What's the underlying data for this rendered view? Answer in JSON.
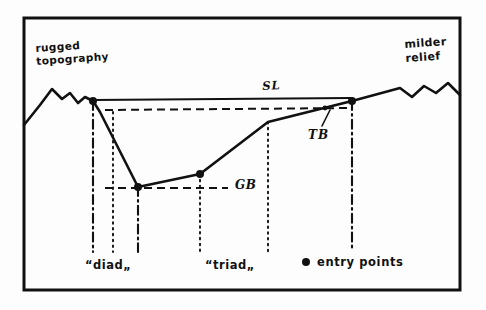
{
  "figure": {
    "kind": "hand-drawn cross-section diagram",
    "background_color": "#fdfdfd",
    "ink_color": "#111111",
    "frame": {
      "x": 24,
      "y": 18,
      "width": 436,
      "height": 272,
      "stroke_width": 3
    }
  },
  "labels": {
    "rugged_topography": "rugged\ntopography",
    "milder_relief": "milder\nrelief",
    "sea_level": "SL",
    "graben_base": "GB",
    "terrace_break": "TB",
    "diad": "“diad„",
    "triad": "“triad„",
    "entry_points": "entry points"
  },
  "legend": {
    "marker": "filled-dot",
    "marker_label": "entry points",
    "marker_radius": 4
  },
  "chart_data": {
    "type": "line",
    "title": "",
    "xlabel": "",
    "ylabel": "",
    "xlim": [
      24,
      460
    ],
    "ylim": [
      290,
      18
    ],
    "grid": false,
    "legend_position": "bottom-right",
    "series": [
      {
        "name": "terrain-profile",
        "stroke": "#111111",
        "width": 2.6,
        "points": [
          [
            24,
            125
          ],
          [
            40,
            105
          ],
          [
            52,
            89
          ],
          [
            62,
            99
          ],
          [
            70,
            93
          ],
          [
            78,
            103
          ],
          [
            85,
            97
          ],
          [
            93,
            101
          ],
          [
            100,
            112
          ],
          [
            138,
            187
          ],
          [
            200,
            174
          ],
          [
            268,
            122
          ],
          [
            352,
            101
          ],
          [
            400,
            88
          ],
          [
            412,
            97
          ],
          [
            424,
            86
          ],
          [
            436,
            93
          ],
          [
            448,
            83
          ],
          [
            460,
            95
          ]
        ]
      },
      {
        "name": "sea-level-solid",
        "stroke": "#111111",
        "width": 2,
        "points": [
          [
            93,
            100
          ],
          [
            352,
            98
          ]
        ]
      }
    ],
    "dashed_lines": [
      {
        "name": "sea-level-dashed",
        "x1": 105,
        "y1": 110,
        "x2": 352,
        "y2": 108,
        "dash": "8 5"
      },
      {
        "name": "graben-base-dashed",
        "x1": 105,
        "y1": 188,
        "x2": 228,
        "y2": 188,
        "dash": "8 5"
      }
    ],
    "vertical_lines": [
      {
        "name": "diad-left",
        "x": 93,
        "y1": 101,
        "y2": 252,
        "style": "dash-dot"
      },
      {
        "name": "diad-mid",
        "x": 113,
        "y1": 112,
        "y2": 252,
        "style": "dotted"
      },
      {
        "name": "diad-right",
        "x": 138,
        "y1": 187,
        "y2": 252,
        "style": "dash-dot"
      },
      {
        "name": "triad-left",
        "x": 200,
        "y1": 174,
        "y2": 252,
        "style": "dotted"
      },
      {
        "name": "triad-right",
        "x": 268,
        "y1": 122,
        "y2": 252,
        "style": "dotted"
      },
      {
        "name": "entry-right",
        "x": 352,
        "y1": 101,
        "y2": 250,
        "style": "dash-dot"
      }
    ],
    "entry_points": [
      {
        "label": "diad-upper-break",
        "x": 93,
        "y": 101
      },
      {
        "label": "graben-floor-west",
        "x": 138,
        "y": 187
      },
      {
        "label": "graben-floor-east",
        "x": 200,
        "y": 174
      },
      {
        "label": "terrace-break-top",
        "x": 352,
        "y": 101
      }
    ],
    "small_points": [
      {
        "label": "TB",
        "x": 325,
        "y": 108,
        "r": 2.4
      }
    ],
    "leader_lines": [
      {
        "name": "tb-leader",
        "x1": 322,
        "y1": 126,
        "x2": 330,
        "y2": 110
      }
    ],
    "legend_dot": {
      "x": 306,
      "y": 262,
      "r": 4
    }
  }
}
